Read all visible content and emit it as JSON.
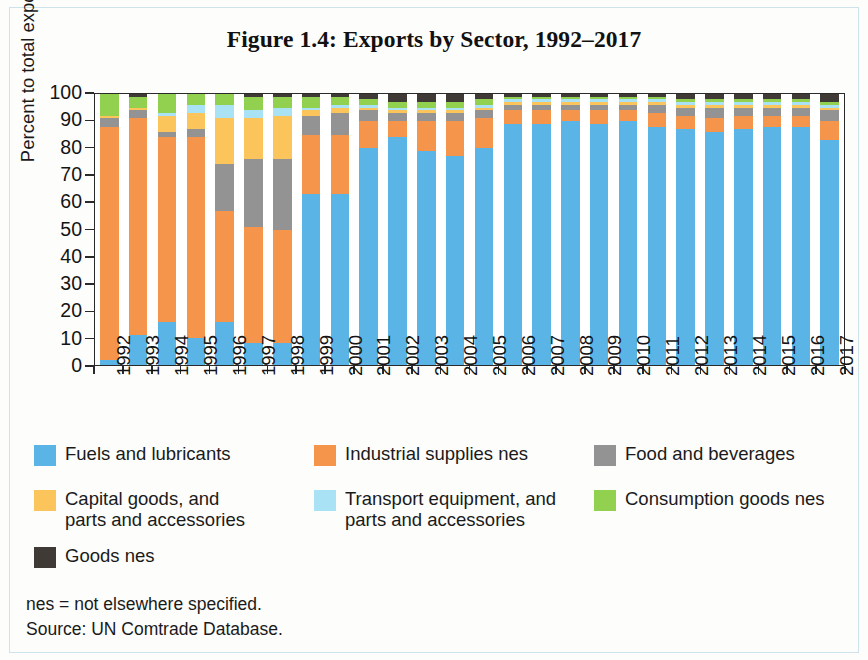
{
  "figure": {
    "title": "Figure 1.4: Exports by Sector, 1992–2017"
  },
  "notes": {
    "line1": "nes = not elsewhere specified.",
    "line2": "Source: UN Comtrade Database."
  },
  "legend": {
    "items": [
      {
        "label": "Fuels and lubricants",
        "color": "#5AB4E5",
        "key": "fuels"
      },
      {
        "label": "Industrial supplies nes",
        "color": "#F5944B",
        "key": "industrial"
      },
      {
        "label": "Food and beverages",
        "color": "#939393",
        "key": "food"
      },
      {
        "label": "Capital goods, and\nparts and accessories",
        "color": "#FBC55B",
        "key": "capital"
      },
      {
        "label": "Transport equipment, and\nparts and accessories",
        "color": "#A8E2F4",
        "key": "transport"
      },
      {
        "label": "Consumption goods nes",
        "color": "#92D04F",
        "key": "consumption"
      },
      {
        "label": "Goods nes",
        "color": "#3F3A35",
        "key": "goodsnes"
      }
    ]
  },
  "chart_data": {
    "type": "bar",
    "subtype": "stacked-100-percent",
    "title": "Figure 1.4: Exports by Sector, 1992–2017",
    "xlabel": "",
    "ylabel": "Percent to total exports",
    "ylim": [
      0,
      100
    ],
    "yticks": [
      0,
      10,
      20,
      30,
      40,
      50,
      60,
      70,
      80,
      90,
      100
    ],
    "grid": false,
    "legend_position": "bottom",
    "categories": [
      "1992",
      "1993",
      "1994",
      "1995",
      "1996",
      "1997",
      "1998",
      "1999",
      "2000",
      "2001",
      "2002",
      "2003",
      "2004",
      "2005",
      "2006",
      "2007",
      "2008",
      "2009",
      "2010",
      "2011",
      "2012",
      "2013",
      "2014",
      "2015",
      "2016",
      "2017"
    ],
    "series": [
      {
        "name": "Fuels and lubricants",
        "color": "#5AB4E5",
        "values": [
          2,
          11,
          16,
          10,
          16,
          8,
          8,
          63,
          63,
          80,
          84,
          79,
          77,
          80,
          89,
          89,
          90,
          89,
          90,
          88,
          87,
          86,
          87,
          88,
          88,
          83
        ]
      },
      {
        "name": "Industrial supplies nes",
        "color": "#F5944B",
        "values": [
          86,
          80,
          68,
          74,
          41,
          43,
          42,
          22,
          22,
          10,
          6,
          11,
          13,
          11,
          5,
          5,
          4,
          5,
          4,
          5,
          5,
          5,
          5,
          4,
          4,
          7
        ]
      },
      {
        "name": "Food and beverages",
        "color": "#939393",
        "values": [
          3,
          3,
          2,
          3,
          17,
          25,
          26,
          7,
          8,
          4,
          3,
          3,
          3,
          3,
          2,
          2,
          2,
          2,
          2,
          3,
          3,
          4,
          3,
          3,
          3,
          4
        ]
      },
      {
        "name": "Capital goods, and parts and accessories",
        "color": "#FBC55B",
        "values": [
          1,
          1,
          6,
          6,
          17,
          15,
          16,
          2,
          2,
          1,
          1,
          1,
          1,
          1,
          1,
          1,
          1,
          1,
          1,
          1,
          1,
          1,
          1,
          1,
          1,
          1
        ]
      },
      {
        "name": "Transport equipment, and parts and accessories",
        "color": "#A8E2F4",
        "values": [
          0,
          0,
          1,
          3,
          5,
          3,
          3,
          1,
          1,
          1,
          1,
          1,
          1,
          1,
          1,
          1,
          1,
          1,
          1,
          1,
          1,
          1,
          1,
          1,
          1,
          1
        ]
      },
      {
        "name": "Consumption goods nes",
        "color": "#92D04F",
        "values": [
          8,
          4,
          7,
          4,
          4,
          5,
          4,
          4,
          3,
          2,
          2,
          2,
          2,
          2,
          1,
          1,
          1,
          1,
          1,
          1,
          1,
          1,
          1,
          1,
          1,
          1
        ]
      },
      {
        "name": "Goods nes",
        "color": "#3F3A35",
        "values": [
          0,
          1,
          0,
          0,
          0,
          1,
          1,
          1,
          1,
          2,
          3,
          3,
          3,
          2,
          1,
          1,
          1,
          1,
          1,
          1,
          2,
          2,
          2,
          2,
          2,
          3
        ]
      }
    ]
  }
}
